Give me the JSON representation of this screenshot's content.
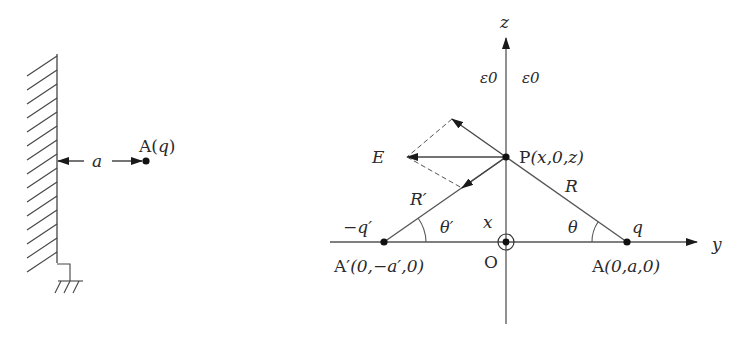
{
  "left_figure": {
    "charge_label": "A(q)",
    "charge_label_parts": {
      "prefix": "A(",
      "var": "q",
      "suffix": ")"
    },
    "distance_label": "a",
    "elements": [
      "grounded-conducting-plane",
      "point-charge",
      "distance-dimension"
    ]
  },
  "right_figure": {
    "axes": {
      "z": "z",
      "y": "y",
      "x": "x",
      "origin": "O"
    },
    "permittivity_left": "ε0",
    "permittivity_right": "ε0",
    "point_P": {
      "name": "P",
      "coords": "(x,0,z)"
    },
    "charge": {
      "label": "q",
      "point": "A",
      "coords": "(0,a,0)"
    },
    "image_charge": {
      "label": "−q′",
      "point": "A′",
      "coords": "(0,−a′,0)"
    },
    "distances": {
      "R": "R",
      "R_prime": "R′"
    },
    "angles": {
      "theta": "θ",
      "theta_prime": "θ′"
    },
    "field_label": "E"
  }
}
